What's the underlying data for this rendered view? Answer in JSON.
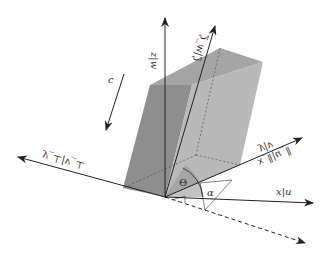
{
  "diagram": {
    "title": "",
    "colors": {
      "box_dark": "#8c8c8c",
      "box_mid": "#a8a8a8",
      "box_light": "#b8b8b8",
      "axis": "#222222",
      "theta_fill": "#9a9a9a"
    },
    "labels": {
      "z_axis": "z|w",
      "zeta_axis": "ζ|w_ζ",
      "y_axis": "y|v",
      "x_parallel_axis": "x_∥|u_∥",
      "x_axis": "x|u",
      "perp_axis": "y_⊥|v_⊥",
      "c_vector": "c",
      "theta_angle": "Θ",
      "alpha_angle": "α"
    },
    "note": "Labels rendered vertically flipped (mirror) in the original figure"
  }
}
